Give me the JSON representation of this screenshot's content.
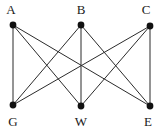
{
  "figure": {
    "name": "bipartite-graph-k33",
    "background_color": "#ffffff",
    "edge_color": "#2b2b2b",
    "vertex_color": "#111111",
    "label_color": "#1a1a1a",
    "edge_width": 1,
    "vertex_radius": 3.4,
    "width": 157,
    "height": 138
  },
  "chart_data": {
    "type": "diagram",
    "title": "",
    "graph_kind": "complete bipartite graph K3,3",
    "nodes": [
      {
        "id": "A",
        "label": "A",
        "x": 13,
        "y": 25,
        "label_x": 11,
        "label_y": 9,
        "group": "top"
      },
      {
        "id": "B",
        "label": "B",
        "x": 81,
        "y": 25,
        "label_x": 81,
        "label_y": 9,
        "group": "top"
      },
      {
        "id": "C",
        "label": "C",
        "x": 150,
        "y": 26,
        "label_x": 146,
        "label_y": 9,
        "group": "top"
      },
      {
        "id": "G",
        "label": "G",
        "x": 13,
        "y": 105,
        "label_x": 13,
        "label_y": 121,
        "group": "bottom"
      },
      {
        "id": "W",
        "label": "W",
        "x": 81,
        "y": 106,
        "label_x": 81,
        "label_y": 121,
        "group": "bottom"
      },
      {
        "id": "E",
        "label": "E",
        "x": 150,
        "y": 106,
        "label_x": 148,
        "label_y": 121,
        "group": "bottom"
      }
    ],
    "edges": [
      {
        "from": "A",
        "to": "G"
      },
      {
        "from": "A",
        "to": "W"
      },
      {
        "from": "A",
        "to": "E"
      },
      {
        "from": "B",
        "to": "G"
      },
      {
        "from": "B",
        "to": "W"
      },
      {
        "from": "B",
        "to": "E"
      },
      {
        "from": "C",
        "to": "G"
      },
      {
        "from": "C",
        "to": "W"
      },
      {
        "from": "C",
        "to": "E"
      }
    ]
  }
}
